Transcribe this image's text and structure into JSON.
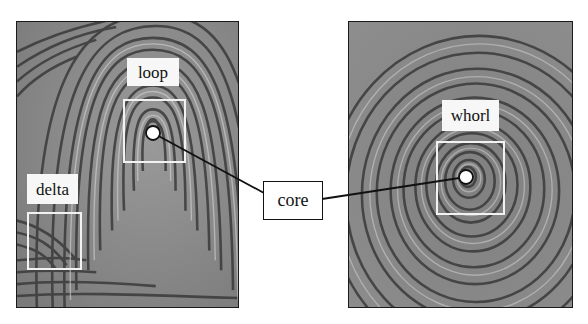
{
  "figure": {
    "colors": {
      "background": "#ffffff",
      "ridge_light": "#c8c8c8",
      "ridge_dark": "#3a3a3a",
      "label_bg": "#f7f7f7",
      "region_outline": "#f2f2f2",
      "connector": "#111111"
    }
  },
  "left_panel": {
    "name": "loop fingerprint",
    "annotations": [
      {
        "id": "loop",
        "label": "loop"
      },
      {
        "id": "delta",
        "label": "delta"
      }
    ]
  },
  "right_panel": {
    "name": "whorl fingerprint",
    "annotations": [
      {
        "id": "whorl",
        "label": "whorl"
      }
    ]
  },
  "callout": {
    "label": "core"
  }
}
